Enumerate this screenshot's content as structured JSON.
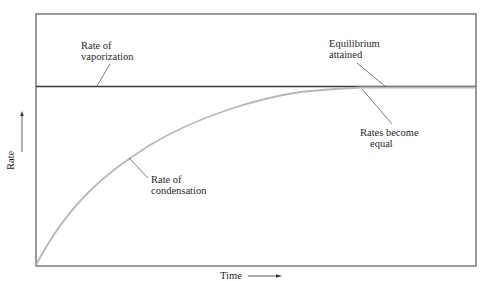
{
  "diagram": {
    "axes": {
      "x_label": "Time",
      "y_label": "Rate"
    },
    "annotations": {
      "vaporization": [
        "Rate of",
        "vaporization"
      ],
      "equilibrium": [
        "Equilibrium",
        "attained"
      ],
      "rates_equal": [
        "Rates become",
        "equal"
      ],
      "condensation": [
        "Rate of",
        "condensation"
      ]
    },
    "series": [
      {
        "name": "Rate of vaporization",
        "shape": "constant horizontal line",
        "color": "#3a3a3a"
      },
      {
        "name": "Rate of condensation",
        "shape": "rising curve approaching vaporization rate",
        "color": "#b8b8b8"
      }
    ],
    "colors": {
      "frame": "#555555",
      "vaporization_line": "#3a3a3a",
      "condensation_curve": "#b8b8b8",
      "leader": "#444444"
    }
  }
}
